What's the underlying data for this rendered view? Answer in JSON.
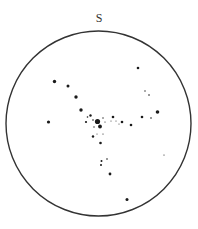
{
  "map": {
    "title_direction_label": "S",
    "horizon": {
      "cx": 98.5,
      "cy": 123.5,
      "r": 92.5,
      "stroke": "#333333"
    },
    "star_color": "#1a1a1a",
    "stars": [
      {
        "x": 97.5,
        "y": 121.5,
        "r": 2.6
      },
      {
        "x": 100.0,
        "y": 126.5,
        "r": 1.9
      },
      {
        "x": 54.5,
        "y": 81.5,
        "r": 1.7
      },
      {
        "x": 68.0,
        "y": 86.0,
        "r": 1.5
      },
      {
        "x": 76.0,
        "y": 97.0,
        "r": 1.7
      },
      {
        "x": 81.0,
        "y": 110.0,
        "r": 1.7
      },
      {
        "x": 48.5,
        "y": 122.0,
        "r": 1.6
      },
      {
        "x": 90.5,
        "y": 115.5,
        "r": 1.2
      },
      {
        "x": 87.5,
        "y": 117.0,
        "r": 0.8
      },
      {
        "x": 86.0,
        "y": 122.0,
        "r": 1.1
      },
      {
        "x": 93.0,
        "y": 120.0,
        "r": 0.8
      },
      {
        "x": 94.0,
        "y": 127.0,
        "r": 0.7
      },
      {
        "x": 103.0,
        "y": 118.0,
        "r": 0.7
      },
      {
        "x": 105.0,
        "y": 122.0,
        "r": 0.6
      },
      {
        "x": 111.0,
        "y": 121.0,
        "r": 0.5
      },
      {
        "x": 113.0,
        "y": 117.0,
        "r": 1.3
      },
      {
        "x": 116.0,
        "y": 121.0,
        "r": 0.5
      },
      {
        "x": 119.0,
        "y": 124.0,
        "r": 0.5
      },
      {
        "x": 122.0,
        "y": 122.0,
        "r": 1.3
      },
      {
        "x": 131.0,
        "y": 125.0,
        "r": 1.3
      },
      {
        "x": 142.0,
        "y": 117.0,
        "r": 1.3
      },
      {
        "x": 151.0,
        "y": 118.0,
        "r": 0.8
      },
      {
        "x": 157.5,
        "y": 112.0,
        "r": 1.8
      },
      {
        "x": 138.0,
        "y": 68.0,
        "r": 1.3
      },
      {
        "x": 145.0,
        "y": 91.0,
        "r": 0.7
      },
      {
        "x": 149.0,
        "y": 95.0,
        "r": 0.8
      },
      {
        "x": 164.0,
        "y": 155.0,
        "r": 0.6
      },
      {
        "x": 93.0,
        "y": 136.5,
        "r": 1.2
      },
      {
        "x": 97.0,
        "y": 134.0,
        "r": 0.5
      },
      {
        "x": 103.0,
        "y": 134.0,
        "r": 0.6
      },
      {
        "x": 100.5,
        "y": 143.0,
        "r": 1.3
      },
      {
        "x": 101.5,
        "y": 161.0,
        "r": 1.0
      },
      {
        "x": 101.0,
        "y": 165.0,
        "r": 1.0
      },
      {
        "x": 107.0,
        "y": 159.0,
        "r": 0.8
      },
      {
        "x": 110.0,
        "y": 174.0,
        "r": 1.4
      },
      {
        "x": 127.0,
        "y": 199.5,
        "r": 1.5
      }
    ]
  }
}
